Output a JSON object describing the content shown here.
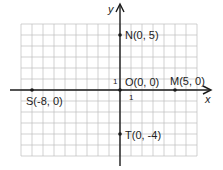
{
  "figure": {
    "type": "coordinate-plane",
    "unit_px": 11,
    "origin_px": [
      120,
      90
    ],
    "grid": {
      "xmin": -9,
      "xmax": 7,
      "ymin": -6,
      "ymax": 6
    },
    "axes": {
      "x_label": "x",
      "y_label": "y",
      "x_tick_label": "1",
      "y_tick_label": "1"
    },
    "colors": {
      "grid": "#bdbdbd",
      "axis": "#1a1a1a",
      "point": "#1a1a1a",
      "text": "#222222"
    }
  },
  "points": [
    {
      "name": "N",
      "coords": "(0, 5)",
      "x": 0,
      "y": 5,
      "label": "N(0, 5)"
    },
    {
      "name": "O",
      "coords": "(0, 0)",
      "x": 0,
      "y": 0,
      "label": "O(0, 0)"
    },
    {
      "name": "M",
      "coords": "(5, 0)",
      "x": 5,
      "y": 0,
      "label": "M(5, 0)"
    },
    {
      "name": "S",
      "coords": "(-8, 0)",
      "x": -8,
      "y": 0,
      "label": "S(-8, 0)"
    },
    {
      "name": "T",
      "coords": "(0, -4)",
      "x": 0,
      "y": -4,
      "label": "T(0, -4)"
    }
  ]
}
